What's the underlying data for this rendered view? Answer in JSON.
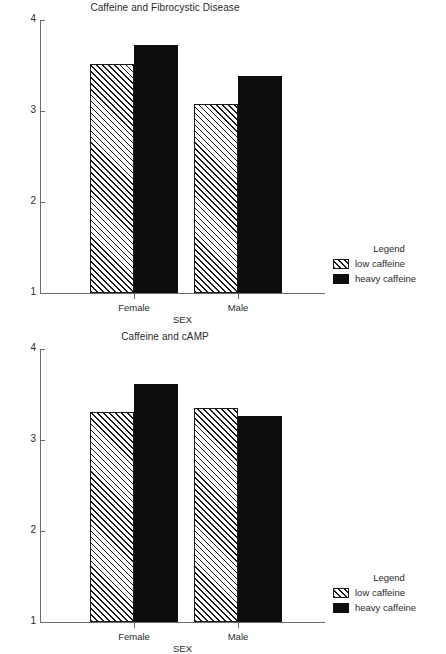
{
  "chart_data": [
    {
      "type": "bar",
      "title": "Caffeine and Fibrocystic Disease",
      "xlabel": "SEX",
      "ylabel": "",
      "categories": [
        "Female",
        "Male"
      ],
      "yticks": [
        "1",
        "2",
        "3",
        "4"
      ],
      "ytick_values": [
        1,
        2,
        3,
        4
      ],
      "ylim": [
        1,
        4
      ],
      "grid": false,
      "legend_position": "right",
      "legend_title": "Legend",
      "series": [
        {
          "name": "low caffeine",
          "pattern": "hatch",
          "color": "#ffffff",
          "values": [
            3.52,
            3.08
          ]
        },
        {
          "name": "heavy caffeine",
          "pattern": "solid",
          "color": "#0d0d0d",
          "values": [
            3.73,
            3.38
          ]
        }
      ]
    },
    {
      "type": "bar",
      "title": "Caffeine and cAMP",
      "xlabel": "SEX",
      "ylabel": "",
      "categories": [
        "Female",
        "Male"
      ],
      "yticks": [
        "1",
        "2",
        "3",
        "4"
      ],
      "ytick_values": [
        1,
        2,
        3,
        4
      ],
      "ylim": [
        1,
        4
      ],
      "grid": false,
      "legend_position": "right",
      "legend_title": "Legend",
      "series": [
        {
          "name": "low caffeine",
          "pattern": "hatch",
          "color": "#ffffff",
          "values": [
            3.31,
            3.35
          ]
        },
        {
          "name": "heavy caffeine",
          "pattern": "solid",
          "color": "#0d0d0d",
          "values": [
            3.61,
            3.26
          ]
        }
      ]
    }
  ]
}
